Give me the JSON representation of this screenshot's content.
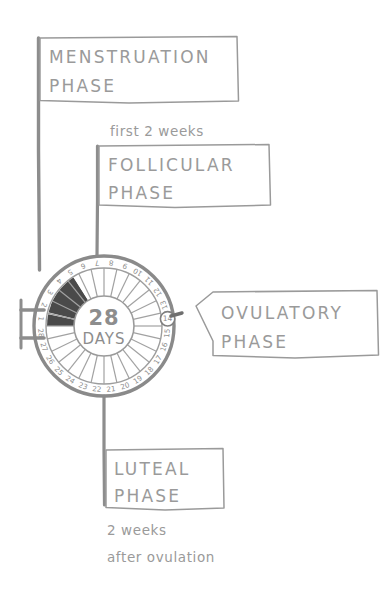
{
  "diagram": {
    "center": {
      "number": "28",
      "unit": "DAYS"
    },
    "colors": {
      "ink": "#9a9a9a",
      "ink_dark": "#7d7d7d",
      "menstruation_fill": "#4a4a4a",
      "background": "#ffffff",
      "ring_stroke": "#8f8f8f"
    },
    "day_numbers": [
      "1",
      "2",
      "3",
      "4",
      "5",
      "6",
      "7",
      "8",
      "9",
      "10",
      "11",
      "12",
      "13",
      "14",
      "15",
      "16",
      "17",
      "18",
      "19",
      "20",
      "21",
      "22",
      "23",
      "24",
      "25",
      "26",
      "27",
      "28"
    ],
    "highlighted_day": "14",
    "shaded_days": [
      "1",
      "2",
      "3",
      "4",
      "5"
    ],
    "labels": {
      "menstruation": {
        "line1": "MENSTRUATION",
        "line2": "PHASE"
      },
      "follicular": {
        "note": "first 2 weeks",
        "line1": "FOLLICULAR",
        "line2": "PHASE"
      },
      "ovulatory": {
        "line1": "OVULATORY",
        "line2": "PHASE"
      },
      "luteal": {
        "line1": "LUTEAL",
        "line2": "PHASE",
        "note_line1": "2 weeks",
        "note_line2": "after ovulation"
      }
    }
  }
}
